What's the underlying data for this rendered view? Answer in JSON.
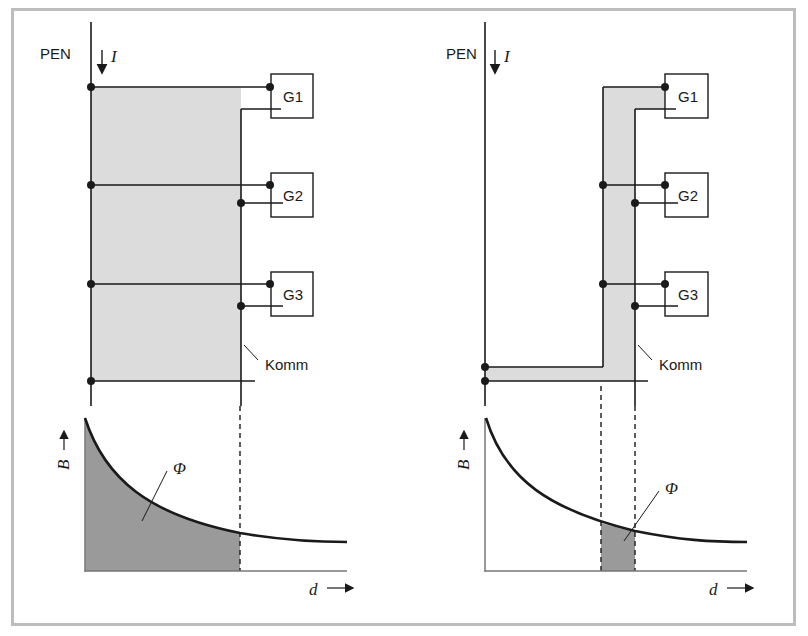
{
  "figure": {
    "left_panel": {
      "pen_label": "PEN",
      "current_label": "I",
      "generators": [
        "G1",
        "G2",
        "G3"
      ],
      "komm_label": "Komm",
      "chart": {
        "y_label": "B",
        "x_label": "d",
        "flux_label": "Φ",
        "shaded_region": "from PEN to Komm"
      }
    },
    "right_panel": {
      "pen_label": "PEN",
      "current_label": "I",
      "generators": [
        "G1",
        "G2",
        "G3"
      ],
      "komm_label": "Komm",
      "chart": {
        "y_label": "B",
        "x_label": "d",
        "flux_label": "Φ",
        "shaded_region": "narrow band near Komm"
      }
    },
    "colors": {
      "line": "#1a1a1a",
      "light_fill": "#dcdcdc",
      "dark_fill": "#9a9a9a",
      "frame": "#bdbdbd"
    }
  }
}
